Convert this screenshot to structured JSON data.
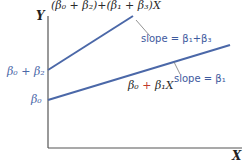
{
  "diagram": {
    "axes": {
      "y_label": "Y",
      "x_label": "X"
    },
    "top_line": {
      "equation": "(β0 + β2) + (β1 + β3)X",
      "equation_display": "(β₀ + β₂)+(β₁ + β₃)X",
      "slope_label": "slope = β₁+β₃",
      "intercept_label": "β₀ + β₂"
    },
    "bottom_line": {
      "equation_display_a": "β₀",
      "equation_display_b": " + ",
      "equation_display_c": "β₁X",
      "slope_label": "slope = β₁",
      "intercept_label": "β₀"
    },
    "colors": {
      "line": "#4b68a8",
      "axis": "#555555",
      "label": "#4b68a8",
      "accent": "#c0392b"
    }
  }
}
